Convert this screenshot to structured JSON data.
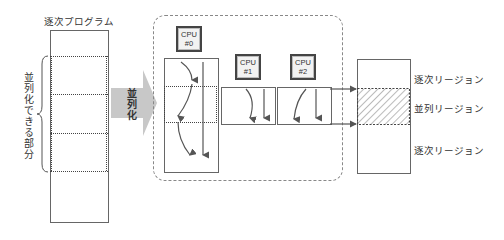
{
  "left": {
    "title": "逐次プログラム",
    "brace_label": "並列化できる部分"
  },
  "arrow": {
    "label": "並列化",
    "color": "#c8c8c8"
  },
  "cpus": [
    {
      "line1": "CPU",
      "line2": "#0"
    },
    {
      "line1": "CPU",
      "line2": "#1"
    },
    {
      "line1": "CPU",
      "line2": "#2"
    }
  ],
  "right": {
    "regions": [
      "逐次リージョン",
      "並列リージョン",
      "逐次リージョン"
    ]
  }
}
